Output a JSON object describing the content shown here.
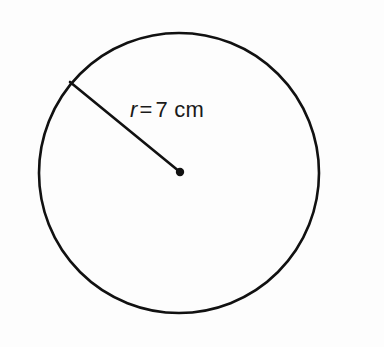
{
  "figure": {
    "type": "geometry-diagram",
    "shape": "circle",
    "background_color": "#fdfdfd",
    "stroke_color": "#111111",
    "text_color": "#1a1a1a",
    "circle": {
      "center_x": 179,
      "center_y": 173,
      "radius_px": 140,
      "stroke_width": 2.6
    },
    "center_dot": {
      "cx": 180,
      "cy": 172,
      "r": 4.2
    },
    "radius_line": {
      "x1": 70,
      "y1": 82,
      "x2": 180,
      "y2": 172,
      "stroke_width": 2.6
    },
    "label": {
      "full_text": "r = 7 cm",
      "symbol": "r",
      "equals": "=",
      "value": "7 cm",
      "measure": "7",
      "unit": "cm",
      "italic_symbol": true,
      "font_size_px": 22
    }
  }
}
